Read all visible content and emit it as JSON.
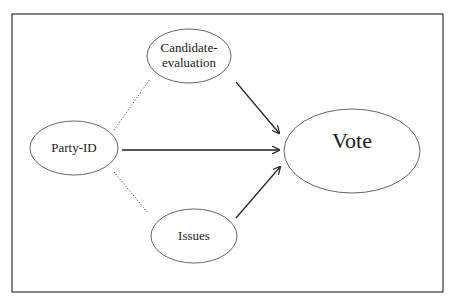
{
  "diagram": {
    "type": "path-model",
    "nodes": [
      {
        "id": "candidate",
        "lines": [
          "Candidate-",
          "evaluation"
        ],
        "cx": 189,
        "cy": 56,
        "rx": 42,
        "ry": 27,
        "font_size": 13
      },
      {
        "id": "partyid",
        "lines": [
          "Party-ID"
        ],
        "cx": 74,
        "cy": 148,
        "rx": 44,
        "ry": 27,
        "font_size": 13
      },
      {
        "id": "issues",
        "lines": [
          "Issues"
        ],
        "cx": 194,
        "cy": 236,
        "rx": 43,
        "ry": 27,
        "font_size": 13
      },
      {
        "id": "vote",
        "lines": [
          "Vote"
        ],
        "cx": 352,
        "cy": 151,
        "rx": 68,
        "ry": 42,
        "font_size": 22
      }
    ],
    "edges": [
      {
        "from": "partyid",
        "to": "candidate",
        "style": "dotted",
        "arrow": false
      },
      {
        "from": "partyid",
        "to": "issues",
        "style": "dotted",
        "arrow": false
      },
      {
        "from": "candidate",
        "to": "vote",
        "style": "solid",
        "arrow": true
      },
      {
        "from": "partyid",
        "to": "vote",
        "style": "solid",
        "arrow": true
      },
      {
        "from": "issues",
        "to": "vote",
        "style": "solid",
        "arrow": true
      }
    ],
    "colors": {
      "frame": "#333333",
      "ellipse_stroke": "#555555",
      "edge": "#222222",
      "text": "#1a1a1a",
      "background": "#ffffff"
    }
  },
  "labels": {
    "candidate_line1": "Candidate-",
    "candidate_line2": "evaluation",
    "partyid": "Party-ID",
    "issues": "Issues",
    "vote": "Vote"
  }
}
